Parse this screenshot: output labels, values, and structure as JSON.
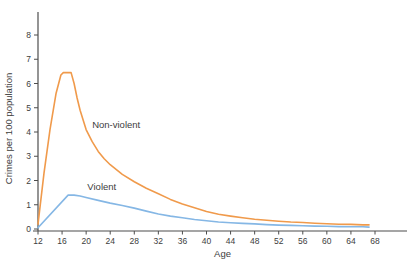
{
  "chart_data": {
    "type": "line",
    "title": "",
    "xlabel": "Age",
    "ylabel": "Crimes per 100 population",
    "xlim": [
      12,
      68
    ],
    "ylim": [
      0,
      8
    ],
    "x_ticks": [
      12,
      16,
      20,
      24,
      28,
      32,
      36,
      40,
      44,
      48,
      52,
      56,
      60,
      64,
      68
    ],
    "y_ticks": [
      0,
      1,
      2,
      3,
      4,
      5,
      6,
      7,
      8
    ],
    "grid": false,
    "legend_position": "inline-annotations",
    "axis_color": "#4d4d4d",
    "tick_label_color": "#3d3d3d",
    "series": [
      {
        "name": "Non-violent",
        "color": "#F09A4B",
        "label_anchor": {
          "age": 21.0,
          "value": 4.15
        },
        "points": [
          [
            12,
            0.2
          ],
          [
            13,
            2.3
          ],
          [
            14,
            4.1
          ],
          [
            15,
            5.6
          ],
          [
            15.8,
            6.35
          ],
          [
            16.2,
            6.45
          ],
          [
            17.5,
            6.45
          ],
          [
            18,
            6.0
          ],
          [
            18.5,
            5.4
          ],
          [
            19,
            4.9
          ],
          [
            20,
            4.1
          ],
          [
            21,
            3.6
          ],
          [
            22,
            3.2
          ],
          [
            23,
            2.9
          ],
          [
            24,
            2.65
          ],
          [
            26,
            2.25
          ],
          [
            28,
            1.95
          ],
          [
            30,
            1.68
          ],
          [
            32,
            1.45
          ],
          [
            34,
            1.22
          ],
          [
            36,
            1.03
          ],
          [
            38,
            0.88
          ],
          [
            40,
            0.72
          ],
          [
            42,
            0.61
          ],
          [
            44,
            0.53
          ],
          [
            46,
            0.46
          ],
          [
            48,
            0.4
          ],
          [
            50,
            0.36
          ],
          [
            52,
            0.32
          ],
          [
            54,
            0.29
          ],
          [
            56,
            0.27
          ],
          [
            58,
            0.24
          ],
          [
            60,
            0.22
          ],
          [
            62,
            0.2
          ],
          [
            64,
            0.19
          ],
          [
            66,
            0.17
          ],
          [
            67,
            0.17
          ]
        ]
      },
      {
        "name": "Violent",
        "color": "#85B7E5",
        "label_anchor": {
          "age": 20.2,
          "value": 1.62
        },
        "points": [
          [
            12,
            0.05
          ],
          [
            17,
            1.4
          ],
          [
            18,
            1.4
          ],
          [
            19,
            1.36
          ],
          [
            20,
            1.3
          ],
          [
            22,
            1.18
          ],
          [
            24,
            1.07
          ],
          [
            26,
            0.97
          ],
          [
            28,
            0.86
          ],
          [
            30,
            0.74
          ],
          [
            32,
            0.62
          ],
          [
            34,
            0.53
          ],
          [
            36,
            0.46
          ],
          [
            38,
            0.39
          ],
          [
            40,
            0.34
          ],
          [
            42,
            0.29
          ],
          [
            44,
            0.26
          ],
          [
            46,
            0.23
          ],
          [
            48,
            0.21
          ],
          [
            50,
            0.18
          ],
          [
            52,
            0.16
          ],
          [
            54,
            0.15
          ],
          [
            56,
            0.13
          ],
          [
            58,
            0.12
          ],
          [
            60,
            0.11
          ],
          [
            62,
            0.1
          ],
          [
            64,
            0.09
          ],
          [
            66,
            0.09
          ],
          [
            67,
            0.08
          ]
        ]
      }
    ]
  }
}
